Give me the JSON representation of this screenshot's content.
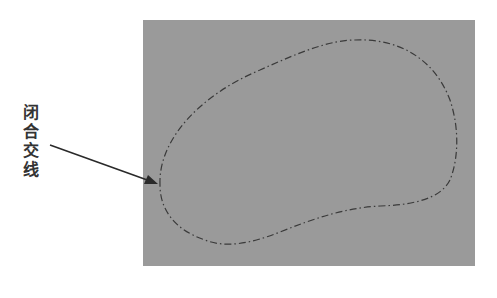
{
  "figure": {
    "label_chars": [
      "闭",
      "合",
      "交",
      "线"
    ],
    "label_text": "闭合交线",
    "panel_color": "#9a9a9a",
    "curve_color": "#3a3a3a",
    "arrow_color": "#2a2a2a"
  }
}
